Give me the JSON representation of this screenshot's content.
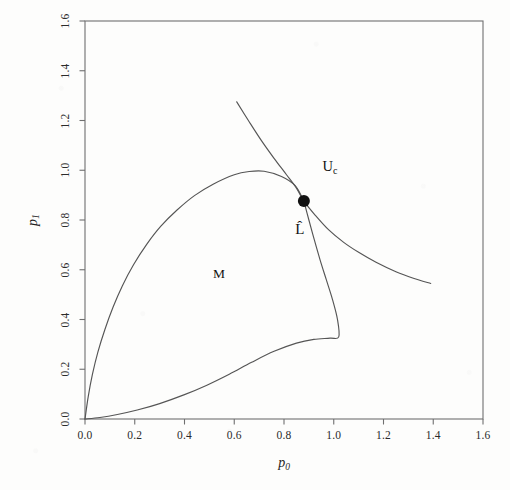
{
  "figure": {
    "background_color": "#fdfdfc",
    "frame_color": "#6f6f6f",
    "curve_color": "#555555",
    "text_color": "#1f1f1f",
    "marker_color": "#111111"
  },
  "chart_data": {
    "type": "line",
    "title": "",
    "xlabel": "p_0",
    "ylabel": "p_1",
    "xlim": [
      0.0,
      1.6
    ],
    "ylim": [
      0.0,
      1.6
    ],
    "grid": false,
    "legend": null,
    "xticks": [
      "0.0",
      "0.2",
      "0.4",
      "0.6",
      "0.8",
      "1.0",
      "1.2",
      "1.4",
      "1.6"
    ],
    "xtick_values": [
      0.0,
      0.2,
      0.4,
      0.6,
      0.8,
      1.0,
      1.2,
      1.4,
      1.6
    ],
    "yticks": [
      "0.0",
      "0.2",
      "0.4",
      "0.6",
      "0.8",
      "1.0",
      "1.2",
      "1.4",
      "1.6"
    ],
    "ytick_values": [
      0.0,
      0.2,
      0.4,
      0.6,
      0.8,
      1.0,
      1.2,
      1.4,
      1.6
    ],
    "series": [
      {
        "name": "loop-upper-branch",
        "points": [
          [
            0.0,
            0.0
          ],
          [
            0.013,
            0.09
          ],
          [
            0.03,
            0.18
          ],
          [
            0.052,
            0.27
          ],
          [
            0.08,
            0.36
          ],
          [
            0.113,
            0.45
          ],
          [
            0.15,
            0.535
          ],
          [
            0.195,
            0.62
          ],
          [
            0.248,
            0.702
          ],
          [
            0.305,
            0.775
          ],
          [
            0.37,
            0.84
          ],
          [
            0.44,
            0.898
          ],
          [
            0.515,
            0.944
          ],
          [
            0.6,
            0.982
          ],
          [
            0.66,
            0.995
          ],
          [
            0.72,
            0.996
          ],
          [
            0.79,
            0.975
          ],
          [
            0.845,
            0.938
          ],
          [
            0.88,
            0.876
          ]
        ]
      },
      {
        "name": "loop-lower-branch",
        "points": [
          [
            0.0,
            0.0
          ],
          [
            0.06,
            0.006
          ],
          [
            0.13,
            0.018
          ],
          [
            0.21,
            0.036
          ],
          [
            0.3,
            0.062
          ],
          [
            0.4,
            0.098
          ],
          [
            0.49,
            0.136
          ],
          [
            0.58,
            0.18
          ],
          [
            0.67,
            0.228
          ],
          [
            0.76,
            0.272
          ],
          [
            0.85,
            0.305
          ],
          [
            0.92,
            0.32
          ],
          [
            0.985,
            0.325
          ],
          [
            1.02,
            0.33
          ],
          [
            1.015,
            0.4
          ],
          [
            0.995,
            0.48
          ],
          [
            0.97,
            0.56
          ],
          [
            0.945,
            0.64
          ],
          [
            0.922,
            0.72
          ],
          [
            0.9,
            0.8
          ],
          [
            0.88,
            0.876
          ]
        ]
      },
      {
        "name": "descending-curve",
        "points": [
          [
            0.61,
            1.275
          ],
          [
            0.66,
            1.195
          ],
          [
            0.71,
            1.118
          ],
          [
            0.76,
            1.048
          ],
          [
            0.81,
            0.982
          ],
          [
            0.85,
            0.928
          ],
          [
            0.88,
            0.876
          ],
          [
            0.925,
            0.82
          ],
          [
            0.98,
            0.76
          ],
          [
            1.04,
            0.71
          ],
          [
            1.1,
            0.67
          ],
          [
            1.17,
            0.63
          ],
          [
            1.25,
            0.592
          ],
          [
            1.32,
            0.566
          ],
          [
            1.39,
            0.545
          ]
        ]
      }
    ],
    "markers": [
      {
        "name": "intersection-point",
        "x": 0.88,
        "y": 0.876,
        "radius_px": 6
      }
    ],
    "annotations": [
      {
        "name": "uc-label",
        "text": "U",
        "subscript": "c",
        "x": 0.955,
        "y": 1.01
      },
      {
        "name": "lhat-label",
        "text": "L̂",
        "subscript": "",
        "x": 0.845,
        "y": 0.755
      },
      {
        "name": "region-label-m",
        "text": "M",
        "subscript": "",
        "x": 0.515,
        "y": 0.578
      }
    ]
  },
  "axes": {
    "x_title_base": "p",
    "x_title_sub": "0",
    "y_title_base": "p",
    "y_title_sub": "1"
  },
  "annotations_text": {
    "uc_base": "U",
    "uc_sub": "c",
    "lhat": "L̂",
    "region_m": "M"
  },
  "caption": {
    "cut_off_text": ""
  }
}
